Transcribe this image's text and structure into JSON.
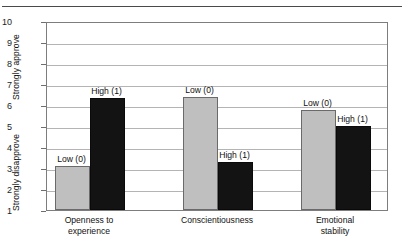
{
  "figure": {
    "top_caption_fragment": "",
    "axis_titles": {
      "y_top": "Strongly approve",
      "y_bottom": "Strongly disapprove"
    }
  },
  "chart_data": {
    "type": "bar",
    "title": "",
    "xlabel": "",
    "ylabel": "Strongly disapprove / Strongly approve",
    "ylim": [
      1,
      10
    ],
    "yticks": [
      1,
      2,
      3,
      4,
      5,
      6,
      7,
      8,
      9,
      10
    ],
    "ytick_labels": [
      "1",
      "2",
      "3",
      "4",
      "5",
      "6",
      "7",
      "8",
      "9",
      "10"
    ],
    "y_axis_endpoint_labels": {
      "low": "Strongly disapprove",
      "high": "Strongly approve"
    },
    "grid": true,
    "grid_axis": "y",
    "legend": "none",
    "categories": [
      "Openness to experience",
      "Conscientiousness",
      "Emotional stability"
    ],
    "series": [
      {
        "name": "Low (0)",
        "color": "#bfbfbf",
        "values": [
          3.1,
          6.4,
          5.75
        ]
      },
      {
        "name": "High (1)",
        "color": "#131313",
        "values": [
          6.35,
          3.3,
          5.0
        ]
      }
    ],
    "point_labels": [
      {
        "category": "Openness to experience",
        "series": "Low (0)",
        "text": "Low (0)",
        "value": 3.1
      },
      {
        "category": "Openness to experience",
        "series": "High (1)",
        "text": "High (1)",
        "value": 6.35
      },
      {
        "category": "Conscientiousness",
        "series": "Low (0)",
        "text": "Low (0)",
        "value": 6.4
      },
      {
        "category": "Conscientiousness",
        "series": "High (1)",
        "text": "High (1)",
        "value": 3.3
      },
      {
        "category": "Emotional stability",
        "series": "Low (0)",
        "text": "Low (0)",
        "value": 5.75
      },
      {
        "category": "Emotional stability",
        "series": "High (1)",
        "text": "High (1)",
        "value": 5.0
      }
    ]
  }
}
